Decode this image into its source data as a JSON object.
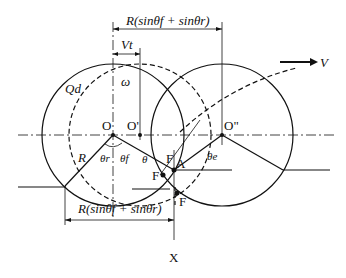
{
  "diagram": {
    "type": "wheel-soil interaction geometry",
    "labels": {
      "top_dimension": "R(sinθf + sinθr)",
      "bottom_dimension": "R(sinθf + sinθr)",
      "displacement": "Vt",
      "velocity": "V",
      "angular_velocity": "ω",
      "flow": "Qd",
      "radius": "R",
      "center_initial": "O",
      "center_shifted": "O'",
      "center_final": "O\"",
      "theta_r": "θr",
      "theta_f": "θf",
      "theta": "θ",
      "theta_e": "θe",
      "point_a": "A",
      "point_f1": "F",
      "point_f2": "F",
      "point_f3": "F",
      "point_x": "X"
    },
    "colors": {
      "line": "#111111",
      "background": "#ffffff"
    }
  }
}
